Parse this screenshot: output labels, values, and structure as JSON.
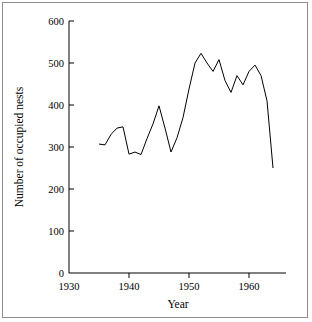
{
  "figure": {
    "background_color": "#ffffff",
    "border_color": "#8c8c8c",
    "line_color": "#000000"
  },
  "chart_data": {
    "type": "line",
    "title": "",
    "xlabel": "Year",
    "ylabel": "Number of occupied nests",
    "xlim": [
      1930,
      1965
    ],
    "ylim": [
      0,
      600
    ],
    "xticks": [
      1930,
      1940,
      1950,
      1960
    ],
    "xtick_labels": [
      "1930",
      "1940",
      "1950",
      "1960"
    ],
    "yticks": [
      0,
      100,
      200,
      300,
      400,
      500,
      600
    ],
    "ytick_labels": [
      "0",
      "100",
      "200",
      "300",
      "400",
      "500",
      "600"
    ],
    "grid": false,
    "legend": false,
    "series": [
      {
        "name": "Occupied nests",
        "x": [
          1935,
          1936,
          1937,
          1938,
          1939,
          1940,
          1941,
          1942,
          1943,
          1944,
          1945,
          1946,
          1947,
          1948,
          1949,
          1950,
          1951,
          1952,
          1953,
          1954,
          1955,
          1956,
          1957,
          1958,
          1959,
          1960,
          1961,
          1962,
          1963,
          1964
        ],
        "values": [
          307,
          305,
          330,
          345,
          348,
          283,
          288,
          282,
          320,
          355,
          398,
          345,
          288,
          322,
          370,
          438,
          500,
          523,
          500,
          480,
          508,
          458,
          430,
          470,
          448,
          480,
          495,
          470,
          410,
          250
        ]
      }
    ]
  },
  "axis_titles": {
    "x": "Year",
    "y": "Number of occupied nests"
  }
}
